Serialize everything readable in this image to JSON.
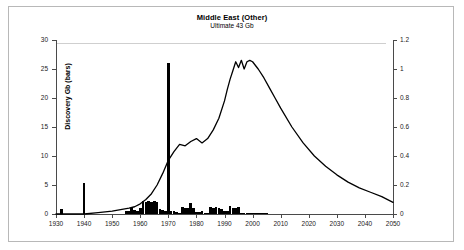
{
  "chart": {
    "title": "Middle East (Other)",
    "subtitle": "Ultimate 43 Gb",
    "ylabel_left": "Discovery Gb (bars)",
    "ylabel_right": "Production Gb a",
    "yticks_left": [
      "0",
      "5",
      "10",
      "15",
      "20",
      "25",
      "30"
    ],
    "yticks_right": [
      "0",
      "0.2",
      "0.4",
      "0.6",
      "0.8",
      "1",
      "1.2"
    ],
    "xticks": [
      "1930",
      "1940",
      "1950",
      "1960",
      "1970",
      "1980",
      "1990",
      "2000",
      "2010",
      "2020",
      "2030",
      "2040",
      "2050"
    ]
  },
  "chart_data": {
    "type": "bar",
    "title": "Middle East (Other)",
    "subtitle": "Ultimate 43 Gb",
    "xlabel": "",
    "ylabel": "Discovery Gb (bars)",
    "ylabel_secondary": "Production Gb a",
    "xlim": [
      1930,
      2050
    ],
    "ylim": [
      0,
      30
    ],
    "ylim_secondary": [
      0,
      1.2
    ],
    "grid": false,
    "legend": "none",
    "series": [
      {
        "name": "Discovery Gb (bars)",
        "type": "bar",
        "axis": "left",
        "color": "#000000",
        "x": [
          1930,
          1931,
          1932,
          1933,
          1934,
          1935,
          1936,
          1937,
          1938,
          1939,
          1940,
          1941,
          1942,
          1943,
          1944,
          1945,
          1946,
          1947,
          1948,
          1949,
          1950,
          1951,
          1952,
          1953,
          1954,
          1955,
          1956,
          1957,
          1958,
          1959,
          1960,
          1961,
          1962,
          1963,
          1964,
          1965,
          1966,
          1967,
          1968,
          1969,
          1970,
          1971,
          1972,
          1973,
          1974,
          1975,
          1976,
          1977,
          1978,
          1979,
          1980,
          1981,
          1982,
          1983,
          1984,
          1985,
          1986,
          1987,
          1988,
          1989,
          1990,
          1991,
          1992,
          1993,
          1994,
          1995,
          1996,
          1997,
          1998,
          1999,
          2000,
          2001,
          2002,
          2003,
          2004,
          2005
        ],
        "values": [
          0,
          0,
          0.8,
          0,
          0,
          0,
          0,
          0,
          0,
          0,
          5.3,
          0,
          0,
          0,
          0,
          0,
          0,
          0,
          0,
          0,
          0,
          0,
          0,
          0,
          0,
          0.5,
          0.6,
          1.0,
          0.7,
          0.6,
          1.1,
          2.2,
          2.0,
          2.2,
          2.1,
          2.2,
          2.0,
          0.8,
          0.7,
          0.6,
          26.1,
          0.6,
          0.5,
          0.3,
          0.2,
          1.2,
          1.1,
          1.0,
          1.9,
          1.1,
          0.4,
          0.3,
          0.6,
          0.2,
          0.2,
          1.2,
          1.1,
          1.2,
          1.0,
          0.9,
          0.6,
          0.5,
          1.3,
          1.1,
          1.0,
          1.2,
          0.2,
          0.2,
          0.2,
          0.2,
          0.2,
          0.2,
          0.1,
          0.1,
          0.1,
          0.1
        ]
      },
      {
        "name": "Production Gb a",
        "type": "line",
        "axis": "right",
        "color": "#000000",
        "x": [
          1930,
          1935,
          1940,
          1945,
          1950,
          1953,
          1956,
          1958,
          1960,
          1962,
          1964,
          1966,
          1968,
          1970,
          1972,
          1974,
          1976,
          1978,
          1980,
          1982,
          1984,
          1986,
          1988,
          1990,
          1991,
          1992,
          1993,
          1994,
          1995,
          1996,
          1997,
          1998,
          1999,
          2000,
          2002,
          2004,
          2006,
          2008,
          2010,
          2014,
          2018,
          2022,
          2026,
          2030,
          2034,
          2038,
          2042,
          2046,
          2050
        ],
        "values": [
          0.0,
          0.0,
          0.0,
          0.01,
          0.02,
          0.03,
          0.04,
          0.05,
          0.07,
          0.1,
          0.14,
          0.2,
          0.28,
          0.37,
          0.43,
          0.48,
          0.47,
          0.5,
          0.52,
          0.49,
          0.52,
          0.58,
          0.66,
          0.78,
          0.86,
          0.93,
          0.99,
          1.05,
          1.01,
          1.06,
          1.0,
          1.05,
          1.06,
          1.05,
          1.0,
          0.94,
          0.87,
          0.8,
          0.73,
          0.6,
          0.49,
          0.4,
          0.33,
          0.27,
          0.22,
          0.18,
          0.15,
          0.12,
          0.08
        ]
      }
    ]
  }
}
